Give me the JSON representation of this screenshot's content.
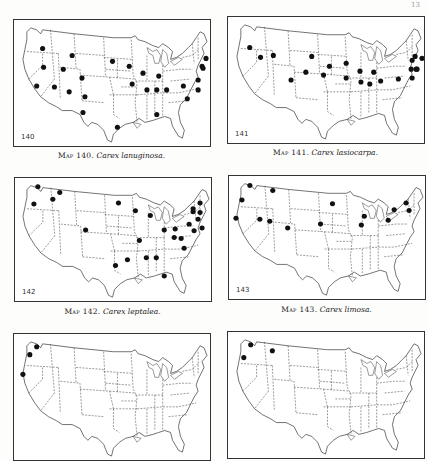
{
  "page_number": "13",
  "maps": [
    {
      "number": "140",
      "caption_prefix": "Map 140.",
      "species": "Carex lanuginosa.",
      "dots": [
        [
          28,
          29
        ],
        [
          58,
          36
        ],
        [
          29,
          48
        ],
        [
          49,
          50
        ],
        [
          68,
          59
        ],
        [
          22,
          67
        ],
        [
          40,
          68
        ],
        [
          55,
          73
        ],
        [
          71,
          78
        ],
        [
          69,
          94
        ],
        [
          104,
          109
        ],
        [
          99,
          42
        ],
        [
          116,
          47
        ],
        [
          130,
          54
        ],
        [
          146,
          57
        ],
        [
          119,
          65
        ],
        [
          134,
          71
        ],
        [
          144,
          71
        ],
        [
          154,
          71
        ],
        [
          171,
          67
        ],
        [
          186,
          61
        ],
        [
          190,
          47
        ],
        [
          186,
          71
        ],
        [
          175,
          80
        ],
        [
          144,
          96
        ],
        [
          194,
          39
        ],
        [
          191,
          49
        ]
      ]
    },
    {
      "number": "141",
      "caption_prefix": "Map 141.",
      "species": "Carex lasiocarpa.",
      "dots": [
        [
          21,
          31
        ],
        [
          45,
          39
        ],
        [
          32,
          41
        ],
        [
          84,
          40
        ],
        [
          102,
          50
        ],
        [
          78,
          56
        ],
        [
          63,
          64
        ],
        [
          96,
          59
        ],
        [
          119,
          62
        ],
        [
          119,
          47
        ],
        [
          133,
          55
        ],
        [
          147,
          56
        ],
        [
          134,
          66
        ],
        [
          143,
          68
        ],
        [
          154,
          65
        ],
        [
          172,
          63
        ],
        [
          185,
          53
        ],
        [
          191,
          53
        ],
        [
          196,
          42
        ],
        [
          186,
          44
        ],
        [
          189,
          40
        ],
        [
          190,
          53
        ],
        [
          186,
          62
        ]
      ]
    },
    {
      "number": "142",
      "caption_prefix": "Map 142.",
      "species": "Carex leptalea.",
      "dots": [
        [
          23,
          9
        ],
        [
          45,
          15
        ],
        [
          38,
          22
        ],
        [
          19,
          27
        ],
        [
          71,
          54
        ],
        [
          104,
          26
        ],
        [
          121,
          34
        ],
        [
          136,
          39
        ],
        [
          179,
          32
        ],
        [
          186,
          26
        ],
        [
          179,
          35
        ],
        [
          184,
          43
        ],
        [
          186,
          36
        ],
        [
          150,
          54
        ],
        [
          161,
          53
        ],
        [
          175,
          48
        ],
        [
          188,
          52
        ],
        [
          160,
          62
        ],
        [
          167,
          63
        ],
        [
          170,
          73
        ],
        [
          125,
          65
        ],
        [
          101,
          91
        ],
        [
          113,
          85
        ],
        [
          132,
          83
        ],
        [
          142,
          83
        ],
        [
          150,
          102
        ],
        [
          180,
          55
        ]
      ]
    },
    {
      "number": "143",
      "caption_prefix": "Map 143.",
      "species": "Carex limosa.",
      "dots": [
        [
          21,
          10
        ],
        [
          44,
          15
        ],
        [
          13,
          25
        ],
        [
          7,
          44
        ],
        [
          31,
          45
        ],
        [
          41,
          47
        ],
        [
          59,
          54
        ],
        [
          92,
          50
        ],
        [
          104,
          29
        ],
        [
          136,
          42
        ],
        [
          133,
          51
        ],
        [
          160,
          46
        ],
        [
          166,
          35
        ],
        [
          178,
          28
        ],
        [
          181,
          36
        ]
      ]
    },
    {
      "number": "",
      "caption_prefix": "",
      "species": "",
      "dots": [
        [
          22,
          13
        ],
        [
          15,
          21
        ],
        [
          8,
          41
        ]
      ]
    },
    {
      "number": "",
      "caption_prefix": "",
      "species": "",
      "dots": [
        [
          22,
          13
        ],
        [
          44,
          19
        ],
        [
          15,
          26
        ]
      ]
    }
  ]
}
